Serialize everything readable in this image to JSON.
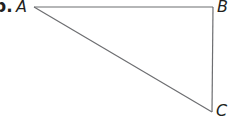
{
  "problem": {
    "number_label": "b.",
    "vertices": [
      {
        "name": "A",
        "x": 34,
        "y": 7
      },
      {
        "name": "B",
        "x": 213,
        "y": 7
      },
      {
        "name": "C",
        "x": 212,
        "y": 112
      }
    ],
    "labels": {
      "A": "A",
      "B": "B",
      "C": "C"
    },
    "stroke_color": "#6d6e71"
  }
}
